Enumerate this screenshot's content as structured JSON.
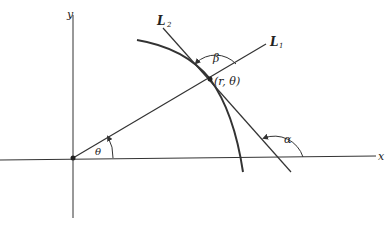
{
  "diagram": {
    "axes": {
      "x_label": "x",
      "y_label": "y"
    },
    "lines": {
      "l1_label": "L",
      "l1_sub": "1",
      "l2_label": "L",
      "l2_sub": "2"
    },
    "point_label": "(r, θ)",
    "angles": {
      "theta": "θ",
      "beta": "β",
      "alpha": "α"
    },
    "colors": {
      "ink": "#333333",
      "background": "#ffffff"
    }
  }
}
